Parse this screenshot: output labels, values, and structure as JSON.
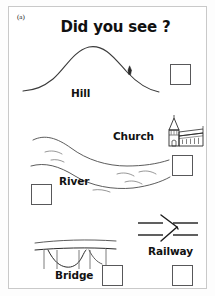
{
  "page": {
    "panel_id": "(a)",
    "title": "Did you see ?",
    "border_color": "#c9c9c9",
    "background_color": "#ffffff",
    "ink_color": "#2b2b2b",
    "checkbox_border_color": "#58585a"
  },
  "items": [
    {
      "label": "Hill",
      "icon": "hill-curve-icon",
      "checkbox_value": "",
      "checked": false
    },
    {
      "label": "Church",
      "icon": "church-building-icon",
      "checkbox_value": "",
      "checked": false
    },
    {
      "label": "River",
      "icon": "river-flow-icon",
      "checkbox_value": "",
      "checked": false
    },
    {
      "label": "Bridge",
      "icon": "arch-bridge-icon",
      "checkbox_value": "",
      "checked": false
    },
    {
      "label": "Railway",
      "icon": "railway-junction-icon",
      "checkbox_value": "",
      "checked": false
    }
  ]
}
